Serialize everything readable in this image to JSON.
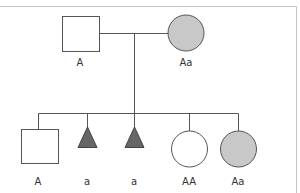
{
  "diagram": {
    "type": "pedigree",
    "colors": {
      "line": "#555555",
      "frame": "#bbbbbb",
      "affected_fill": "#c8c8c8",
      "triangle_fill": "#666666",
      "unaffected_fill": "#ffffff"
    },
    "parents": {
      "father": {
        "shape": "square",
        "label": "A",
        "filled": false
      },
      "mother": {
        "shape": "circle",
        "label": "Aa",
        "filled": true
      }
    },
    "children": [
      {
        "shape": "square",
        "label": "A",
        "filled": false
      },
      {
        "shape": "triangle",
        "label": "a",
        "filled": true
      },
      {
        "shape": "triangle",
        "label": "a",
        "filled": true
      },
      {
        "shape": "circle",
        "label": "AA",
        "filled": false
      },
      {
        "shape": "circle",
        "label": "Aa",
        "filled": true
      }
    ]
  }
}
